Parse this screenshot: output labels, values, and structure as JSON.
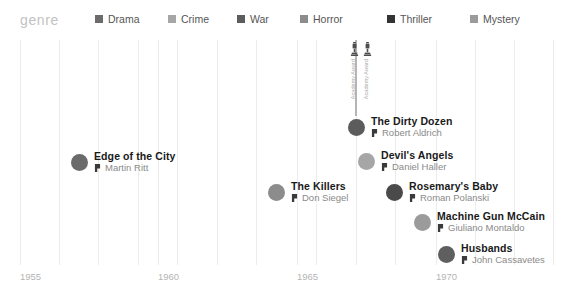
{
  "legend": {
    "title": "genre",
    "items": [
      {
        "label": "Drama",
        "color": "#6b6b6b",
        "x": 95,
        "icon": "legend-swatch-drama"
      },
      {
        "label": "Crime",
        "color": "#a6a6a6",
        "x": 168,
        "icon": "legend-swatch-crime"
      },
      {
        "label": "War",
        "color": "#5c5c5c",
        "x": 237,
        "icon": "legend-swatch-war"
      },
      {
        "label": "Horror",
        "color": "#8c8c8c",
        "x": 300,
        "icon": "legend-swatch-horror"
      },
      {
        "label": "Thriller",
        "color": "#333333",
        "x": 387,
        "icon": "legend-swatch-thriller"
      },
      {
        "label": "Mystery",
        "color": "#9b9b9b",
        "x": 470,
        "icon": "legend-swatch-mystery"
      }
    ]
  },
  "axis": {
    "ticks": [
      {
        "label": "1955",
        "x": 20
      },
      {
        "label": "1960",
        "x": 158
      },
      {
        "label": "1965",
        "x": 297
      },
      {
        "label": "1970",
        "x": 436
      }
    ]
  },
  "gridlines": [
    20,
    59,
    98,
    138,
    158,
    177,
    217,
    256,
    297,
    316,
    356,
    395,
    436,
    475,
    514,
    553
  ],
  "award_callout": {
    "icon_name": "award-trophy-icon",
    "columns": [
      {
        "label": "Academy Award",
        "x": 10
      },
      {
        "label": "Academy Award",
        "x": 23
      }
    ]
  },
  "chart_data": {
    "type": "scatter",
    "title": "genre",
    "xlabel": "",
    "ylabel": "",
    "xlim": [
      1955,
      1971
    ],
    "grid": true,
    "legend_position": "top",
    "points": [
      {
        "title": "Edge of the City",
        "director": "Martin Ritt",
        "year": 1957,
        "genre": "Drama",
        "color": "#6b6b6b",
        "px": 71,
        "py": 111,
        "awards": 0
      },
      {
        "title": "The Dirty Dozen",
        "director": "Robert Aldrich",
        "year": 1967,
        "genre": "War",
        "color": "#5c5c5c",
        "px": 348,
        "py": 76,
        "awards": 2
      },
      {
        "title": "Devil's Angels",
        "director": "Daniel Haller",
        "year": 1967,
        "genre": "Crime",
        "color": "#a6a6a6",
        "px": 358,
        "py": 110,
        "awards": 0
      },
      {
        "title": "The Killers",
        "director": "Don Siegel",
        "year": 1964,
        "genre": "Crime",
        "color": "#8c8c8c",
        "px": 268,
        "py": 141,
        "awards": 0
      },
      {
        "title": "Rosemary's Baby",
        "director": "Roman Polanski",
        "year": 1968,
        "genre": "Horror",
        "color": "#4a4a4a",
        "px": 386,
        "py": 141,
        "awards": 0
      },
      {
        "title": "Machine Gun McCain",
        "director": "Giuliano Montaldo",
        "year": 1969,
        "genre": "Crime",
        "color": "#9b9b9b",
        "px": 414,
        "py": 171,
        "awards": 0
      },
      {
        "title": "Husbands",
        "director": "John Cassavetes",
        "year": 1970,
        "genre": "Drama",
        "color": "#5f5f5f",
        "px": 438,
        "py": 203,
        "awards": 0
      }
    ]
  }
}
